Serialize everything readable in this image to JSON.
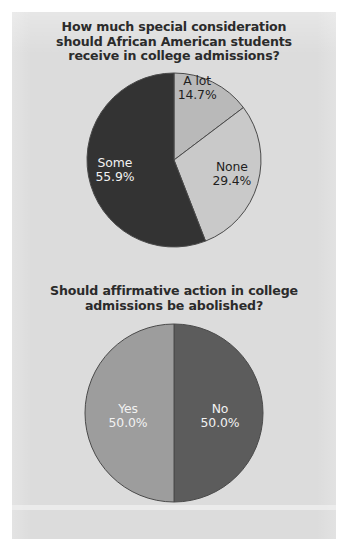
{
  "figure": {
    "background_color": "#dcdcdc",
    "paper_color": "#ffffff"
  },
  "chart_data": [
    {
      "type": "pie",
      "title": "How much special consideration\nshould African American students\nreceive in college admissions?",
      "title_lines": [
        "How much special consideration",
        "should African American students",
        "receive in college admissions?"
      ],
      "categories": [
        "A lot",
        "None",
        "Some"
      ],
      "values": [
        14.7,
        29.4,
        55.9
      ],
      "value_labels": [
        "14.7%",
        "29.4%",
        "55.9%"
      ],
      "colors": [
        "#b9b9b9",
        "#c9c9c9",
        "#333333"
      ],
      "label_colors": [
        "#1f1f1f",
        "#1f1f1f",
        "#f2f2f2"
      ],
      "start_angle_deg": 0,
      "direction": "clockwise",
      "units": "percent",
      "legend": "none",
      "slices": [
        {
          "label": "A lot",
          "value": 14.7,
          "value_label": "14.7%",
          "color": "#b9b9b9",
          "label_color": "#1f1f1f"
        },
        {
          "label": "None",
          "value": 29.4,
          "value_label": "29.4%",
          "color": "#c9c9c9",
          "label_color": "#1f1f1f"
        },
        {
          "label": "Some",
          "value": 55.9,
          "value_label": "55.9%",
          "color": "#333333",
          "label_color": "#f2f2f2"
        }
      ]
    },
    {
      "type": "pie",
      "title": "Should affirmative action in college\nadmissions be abolished?",
      "title_lines": [
        "Should affirmative action in college",
        "admissions be abolished?"
      ],
      "categories": [
        "Yes",
        "No"
      ],
      "values": [
        50.0,
        50.0
      ],
      "value_labels": [
        "50.0%",
        "50.0%"
      ],
      "colors": [
        "#9d9d9d",
        "#5c5c5c"
      ],
      "label_colors": [
        "#f2f2f2",
        "#f2f2f2"
      ],
      "start_angle_deg": 0,
      "direction": "clockwise",
      "units": "percent",
      "legend": "none",
      "slices": [
        {
          "label": "No",
          "value": 50.0,
          "value_label": "50.0%",
          "color": "#5c5c5c",
          "label_color": "#f2f2f2"
        },
        {
          "label": "Yes",
          "value": 50.0,
          "value_label": "50.0%",
          "color": "#9d9d9d",
          "label_color": "#f2f2f2"
        }
      ]
    }
  ]
}
